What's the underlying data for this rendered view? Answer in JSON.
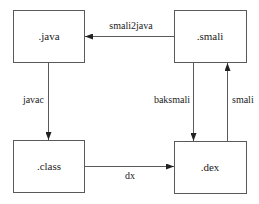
{
  "diagram": {
    "type": "flowchart",
    "colors": {
      "stroke": "#5a5a5a",
      "text": "#222222",
      "background": "#ffffff"
    },
    "nodes": [
      {
        "id": "java",
        "label": ".java"
      },
      {
        "id": "smali",
        "label": ".smali"
      },
      {
        "id": "class",
        "label": ".class"
      },
      {
        "id": "dex",
        "label": ".dex"
      }
    ],
    "edges": [
      {
        "from": "smali",
        "to": "java",
        "label": "smali2java"
      },
      {
        "from": "java",
        "to": "class",
        "label": "javac"
      },
      {
        "from": "class",
        "to": "dex",
        "label": "dx"
      },
      {
        "from": "smali",
        "to": "dex",
        "label": "baksmali"
      },
      {
        "from": "dex",
        "to": "smali",
        "label": "smali"
      }
    ]
  }
}
